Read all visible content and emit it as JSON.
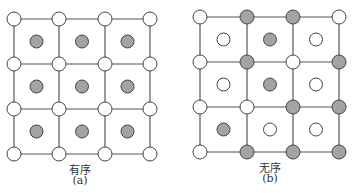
{
  "colors": {
    "line": "#555555",
    "white_atom": "#ffffff",
    "gray_atom": "#a3a3a3",
    "stroke": "#444444"
  },
  "panels": [
    {
      "id": "a",
      "caption": "有序",
      "sublabel": "(a)",
      "grid_x": [
        14,
        59,
        105,
        150
      ],
      "grid_y": [
        19,
        64,
        109,
        154
      ],
      "corners": [
        [
          "white",
          "white",
          "white",
          "white"
        ],
        [
          "white",
          "white",
          "white",
          "white"
        ],
        [
          "white",
          "white",
          "white",
          "white"
        ],
        [
          "white",
          "white",
          "white",
          "white"
        ]
      ],
      "centers": [
        [
          "gray",
          "gray",
          "gray"
        ],
        [
          "gray",
          "gray",
          "gray"
        ],
        [
          "gray",
          "gray",
          "gray"
        ]
      ],
      "label_x": 80
    },
    {
      "id": "b",
      "caption": "无序",
      "sublabel": "(b)",
      "grid_x": [
        200,
        247,
        293,
        339
      ],
      "grid_y": [
        17,
        62,
        107,
        152
      ],
      "corners": [
        [
          "white",
          "gray",
          "gray",
          "white"
        ],
        [
          "white",
          "gray",
          "white",
          "gray"
        ],
        [
          "white",
          "white",
          "gray",
          "gray"
        ],
        [
          "white",
          "gray",
          "gray",
          "gray"
        ]
      ],
      "centers": [
        [
          "white",
          "gray",
          "white"
        ],
        [
          "white",
          "gray",
          "white"
        ],
        [
          "gray",
          "white",
          "white"
        ]
      ],
      "label_x": 270
    }
  ]
}
